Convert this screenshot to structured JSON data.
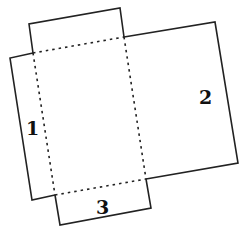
{
  "diagram": {
    "type": "box-net",
    "line_color": "#222222",
    "fold_line_style": "dotted",
    "panels": [
      {
        "id": "top-flap",
        "label": ""
      },
      {
        "id": "flap-1",
        "label": "1"
      },
      {
        "id": "panel-2",
        "label": "2"
      },
      {
        "id": "flap-3",
        "label": "3"
      },
      {
        "id": "center",
        "label": ""
      }
    ],
    "labels": {
      "one": "1",
      "two": "2",
      "three": "3"
    }
  }
}
